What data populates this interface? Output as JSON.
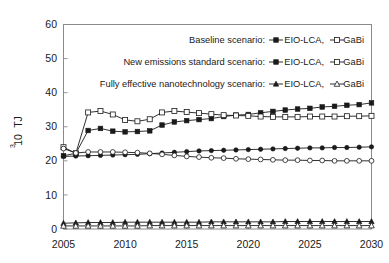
{
  "chart_data": {
    "type": "line",
    "title": "",
    "xlabel": "",
    "ylabel": "10³ TJ",
    "ylabel_base": "10",
    "ylabel_exp": "3",
    "ylabel_unit": "TJ",
    "xlim": [
      2005,
      2030
    ],
    "ylim": [
      0,
      60
    ],
    "xticks": [
      2005,
      2010,
      2015,
      2020,
      2025,
      2030
    ],
    "xtick_labels": [
      "2005",
      "2010",
      "2015",
      "2020",
      "2025",
      "2030"
    ],
    "yticks": [
      0,
      10,
      20,
      30,
      40,
      50,
      60
    ],
    "ytick_labels": [
      "0",
      "10",
      "20",
      "30",
      "40",
      "50",
      "60"
    ],
    "grid": false,
    "legend_position": "upper-right-inside",
    "x": [
      2005,
      2006,
      2007,
      2008,
      2009,
      2010,
      2011,
      2012,
      2013,
      2014,
      2015,
      2016,
      2017,
      2018,
      2019,
      2020,
      2021,
      2022,
      2023,
      2024,
      2025,
      2026,
      2027,
      2028,
      2029,
      2030
    ],
    "series": [
      {
        "name": "Baseline scenario: EIO-LCA",
        "scenario": "Baseline scenario",
        "model": "EIO-LCA",
        "marker": "filled-square",
        "values": [
          21.5,
          22.2,
          28.9,
          29.5,
          28.7,
          28.5,
          28.6,
          28.8,
          30.5,
          31.4,
          31.8,
          32.1,
          32.4,
          33.0,
          33.4,
          33.6,
          34.1,
          34.5,
          34.9,
          35.2,
          35.4,
          35.8,
          36.0,
          36.3,
          36.5,
          37.0
        ]
      },
      {
        "name": "Baseline scenario: GaBi",
        "scenario": "Baseline scenario",
        "model": "GaBi",
        "marker": "open-square",
        "values": [
          24.0,
          22.2,
          34.2,
          34.6,
          33.6,
          32.0,
          31.6,
          32.2,
          34.2,
          34.6,
          34.3,
          34.0,
          33.7,
          33.4,
          33.3,
          33.2,
          33.0,
          32.9,
          32.9,
          32.9,
          33.0,
          33.0,
          33.0,
          33.1,
          33.1,
          33.2
        ]
      },
      {
        "name": "New emissions standard scenario: EIO-LCA",
        "scenario": "New emissions standard scenario",
        "model": "EIO-LCA",
        "marker": "filled-circle",
        "values": [
          21.3,
          21.4,
          21.5,
          21.6,
          21.7,
          21.8,
          21.9,
          22.1,
          22.3,
          22.5,
          22.7,
          22.9,
          23.0,
          23.1,
          23.2,
          23.3,
          23.4,
          23.5,
          23.6,
          23.7,
          23.8,
          23.8,
          23.9,
          23.9,
          24.0,
          24.1
        ]
      },
      {
        "name": "New emissions standard scenario: GaBi",
        "scenario": "New emissions standard scenario",
        "model": "GaBi",
        "marker": "open-circle",
        "values": [
          23.6,
          22.3,
          22.6,
          22.6,
          22.6,
          22.5,
          22.4,
          22.2,
          21.9,
          21.6,
          21.3,
          21.1,
          20.9,
          20.8,
          20.6,
          20.5,
          20.4,
          20.3,
          20.2,
          20.2,
          20.1,
          20.1,
          20.0,
          20.0,
          20.0,
          20.0
        ]
      },
      {
        "name": "Fully effective nanotechnology scenario: EIO-LCA",
        "scenario": "Fully effective nanotechnology scenario",
        "model": "EIO-LCA",
        "marker": "filled-triangle",
        "values": [
          1.7,
          1.8,
          1.9,
          1.9,
          1.9,
          2.0,
          2.0,
          2.0,
          2.0,
          2.0,
          2.0,
          2.0,
          2.1,
          2.1,
          2.1,
          2.1,
          2.1,
          2.1,
          2.2,
          2.2,
          2.2,
          2.2,
          2.2,
          2.2,
          2.2,
          2.2
        ]
      },
      {
        "name": "Fully effective nanotechnology scenario: GaBi",
        "scenario": "Fully effective nanotechnology scenario",
        "model": "GaBi",
        "marker": "open-triangle",
        "values": [
          0.9,
          0.9,
          0.9,
          0.9,
          0.9,
          0.9,
          0.9,
          1.0,
          1.0,
          1.0,
          1.0,
          1.0,
          1.0,
          1.0,
          1.0,
          1.0,
          1.0,
          1.0,
          1.0,
          1.0,
          1.0,
          1.0,
          1.0,
          1.0,
          1.0,
          1.0
        ]
      }
    ]
  },
  "legend": {
    "rows": [
      {
        "scenario_label": "Baseline scenario:",
        "entry1_label": "EIO-LCA,",
        "entry1_marker": "filled-square",
        "entry2_label": "GaBi",
        "entry2_marker": "open-square"
      },
      {
        "scenario_label": "New emissions standard scenario:",
        "entry1_label": "EIO-LCA,",
        "entry1_marker": "filled-square",
        "entry2_label": "GaBi",
        "entry2_marker": "open-square"
      },
      {
        "scenario_label": "Fully effective nanotechnology scenario:",
        "entry1_label": "EIO-LCA,",
        "entry1_marker": "filled-triangle",
        "entry2_label": "GaBi",
        "entry2_marker": "open-triangle"
      }
    ]
  },
  "colors": {
    "ink": "#1a1a1a",
    "frame": "#8a8a8a",
    "background": "#ffffff"
  }
}
